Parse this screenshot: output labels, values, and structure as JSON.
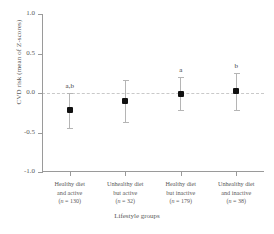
{
  "chart_data": {
    "type": "scatter",
    "title": "",
    "xlabel": "Lifestyle groups",
    "ylabel": "CVD risk (mean of Z-scores)",
    "ylim": [
      -1.0,
      1.0
    ],
    "yticks": [
      "1.0",
      "0.5",
      "0.0",
      "-0.5",
      "-1.0"
    ],
    "ytick_values": [
      1.0,
      0.5,
      0.0,
      -0.5,
      -1.0
    ],
    "grid": false,
    "legend": "none",
    "reference_line": 0.0,
    "categories": [
      "Healthy diet and active",
      "Unhealthy diet but active",
      "Healthy diet but inactive",
      "Unhealthy diet and inactive"
    ],
    "values": [
      -0.22,
      -0.1,
      -0.01,
      0.02
    ],
    "error_low": [
      -0.44,
      -0.37,
      -0.22,
      -0.22
    ],
    "error_high": [
      0.0,
      0.17,
      0.2,
      0.25
    ],
    "annotations": [
      "a,b",
      "",
      "a",
      "b"
    ],
    "group_sizes": [
      130,
      32,
      179,
      38
    ]
  },
  "axes": {
    "y_title": "CVD risk (mean of Z-scores)",
    "x_title": "Lifestyle groups",
    "y_tick_labels": [
      "1.0",
      "0.5",
      "0.0",
      "-0.5",
      "-1.0"
    ]
  },
  "groups": [
    {
      "line1": "Healthy diet",
      "line2": "and active",
      "n_prefix": "(n",
      "n_value": " = 130)",
      "n_text": "(n = 130)",
      "mean": -0.22,
      "ci_low": -0.44,
      "ci_high": 0.0,
      "sig": "a,b"
    },
    {
      "line1": "Unhealthy diet",
      "line2": "but active",
      "n_prefix": "(n",
      "n_value": " = 32)",
      "n_text": "(n = 32)",
      "mean": -0.1,
      "ci_low": -0.37,
      "ci_high": 0.17,
      "sig": ""
    },
    {
      "line1": "Healthy diet",
      "line2": "but inactive",
      "n_prefix": "(n",
      "n_value": " = 179)",
      "n_text": "(n = 179)",
      "mean": -0.01,
      "ci_low": -0.22,
      "ci_high": 0.2,
      "sig": "a"
    },
    {
      "line1": "Unhealthy diet",
      "line2": "and inactive",
      "n_prefix": "(n",
      "n_value": " = 38)",
      "n_text": "(n = 38)",
      "mean": 0.02,
      "ci_low": -0.22,
      "ci_high": 0.25,
      "sig": "b"
    }
  ]
}
